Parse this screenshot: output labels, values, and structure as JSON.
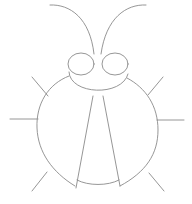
{
  "drawing": {
    "subject": "beetle line drawing",
    "stroke_color": "#8a8a8a",
    "stroke_width": 0.9,
    "background": "#ffffff",
    "parts": [
      "antenna-left",
      "antenna-right",
      "eye-left",
      "eye-right",
      "head",
      "body",
      "wing-left",
      "wing-right",
      "leg-front-left",
      "leg-mid-left",
      "leg-back-left",
      "leg-front-right",
      "leg-mid-right",
      "leg-back-right"
    ]
  }
}
